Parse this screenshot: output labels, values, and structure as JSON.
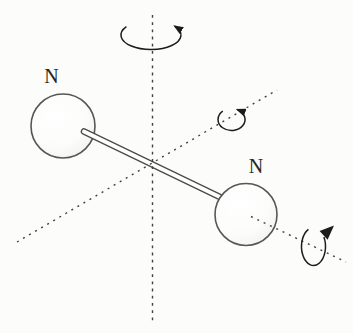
{
  "figure": {
    "type": "diatomic-molecule-rotation-diagram",
    "atom_labels": {
      "left": "N",
      "right": "N"
    }
  },
  "icons": {
    "vertical_axis_arrow": "rotation-arrow-icon",
    "diagonal_axis_arrow": "rotation-arrow-icon",
    "bond_axis_arrow": "rotation-arrow-icon"
  },
  "colors": {
    "background": "#fcfcfa",
    "line": "#404040",
    "bond-stroke": "#4a4a4a",
    "sphere-stroke": "#565656",
    "arrow": "#1c1c1c",
    "label": "#262626"
  }
}
